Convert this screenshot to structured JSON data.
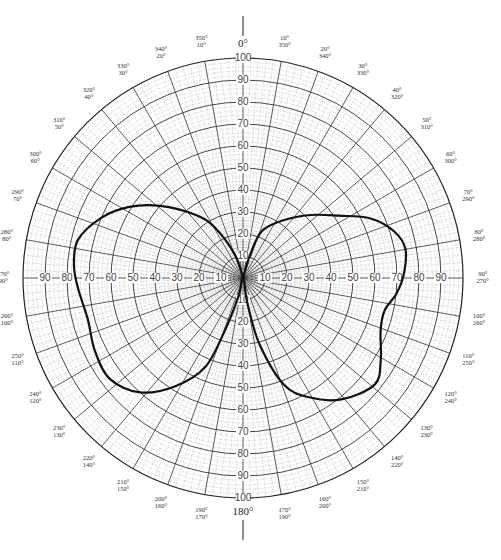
{
  "chart_data": {
    "type": "polar",
    "title": "",
    "radial_axis": {
      "min": 0,
      "max": 100,
      "major_step": 10,
      "minor_step": 2,
      "tick_labels": [
        "10",
        "20",
        "30",
        "40",
        "50",
        "60",
        "70",
        "80",
        "90",
        "100"
      ]
    },
    "angular_axis": {
      "major_step_deg": 10,
      "minor_step_deg": 2,
      "direction": "clockwise",
      "zero": "top"
    },
    "cardinal_labels": {
      "top": "0°",
      "bottom": "180°"
    },
    "angle_labels": [
      {
        "deg": 10,
        "outer": "10°",
        "inner": "350°"
      },
      {
        "deg": 20,
        "outer": "20°",
        "inner": "340°"
      },
      {
        "deg": 30,
        "outer": "30°",
        "inner": "330°"
      },
      {
        "deg": 40,
        "outer": "40°",
        "inner": "320°"
      },
      {
        "deg": 50,
        "outer": "50°",
        "inner": "310°"
      },
      {
        "deg": 60,
        "outer": "60°",
        "inner": "300°"
      },
      {
        "deg": 70,
        "outer": "70°",
        "inner": "290°"
      },
      {
        "deg": 80,
        "outer": "80°",
        "inner": "280°"
      },
      {
        "deg": 90,
        "outer": "90°",
        "inner": "270°"
      },
      {
        "deg": 100,
        "outer": "100°",
        "inner": "260°"
      },
      {
        "deg": 110,
        "outer": "110°",
        "inner": "250°"
      },
      {
        "deg": 120,
        "outer": "120°",
        "inner": "240°"
      },
      {
        "deg": 130,
        "outer": "130°",
        "inner": "230°"
      },
      {
        "deg": 140,
        "outer": "140°",
        "inner": "220°"
      },
      {
        "deg": 150,
        "outer": "150°",
        "inner": "210°"
      },
      {
        "deg": 160,
        "outer": "160°",
        "inner": "200°"
      },
      {
        "deg": 170,
        "outer": "170°",
        "inner": "190°"
      },
      {
        "deg": 190,
        "outer": "190°",
        "inner": "170°"
      },
      {
        "deg": 200,
        "outer": "200°",
        "inner": "160°"
      },
      {
        "deg": 210,
        "outer": "210°",
        "inner": "150°"
      },
      {
        "deg": 220,
        "outer": "220°",
        "inner": "140°"
      },
      {
        "deg": 230,
        "outer": "230°",
        "inner": "130°"
      },
      {
        "deg": 240,
        "outer": "240°",
        "inner": "120°"
      },
      {
        "deg": 250,
        "outer": "250°",
        "inner": "110°"
      },
      {
        "deg": 260,
        "outer": "260°",
        "inner": "100°"
      },
      {
        "deg": 270,
        "outer": "270°",
        "inner": "90°"
      },
      {
        "deg": 280,
        "outer": "280°",
        "inner": "80°"
      },
      {
        "deg": 290,
        "outer": "290°",
        "inner": "70°"
      },
      {
        "deg": 300,
        "outer": "300°",
        "inner": "60°"
      },
      {
        "deg": 310,
        "outer": "310°",
        "inner": "50°"
      },
      {
        "deg": 320,
        "outer": "320°",
        "inner": "40°"
      },
      {
        "deg": 330,
        "outer": "330°",
        "inner": "30°"
      },
      {
        "deg": 340,
        "outer": "340°",
        "inner": "20°"
      },
      {
        "deg": 350,
        "outer": "350°",
        "inner": "10°"
      }
    ],
    "series": [
      {
        "name": "radiation pattern",
        "color": "#111111",
        "points": [
          {
            "angle": 0,
            "r": 0
          },
          {
            "angle": 17,
            "r": 11
          },
          {
            "angle": 22,
            "r": 23
          },
          {
            "angle": 35,
            "r": 32
          },
          {
            "angle": 47,
            "r": 42
          },
          {
            "angle": 57,
            "r": 52
          },
          {
            "angle": 65,
            "r": 64
          },
          {
            "angle": 73,
            "r": 72
          },
          {
            "angle": 80,
            "r": 75
          },
          {
            "angle": 89,
            "r": 73
          },
          {
            "angle": 96,
            "r": 70
          },
          {
            "angle": 103,
            "r": 66
          },
          {
            "angle": 111,
            "r": 67
          },
          {
            "angle": 121,
            "r": 73
          },
          {
            "angle": 129,
            "r": 77
          },
          {
            "angle": 141,
            "r": 71
          },
          {
            "angle": 151,
            "r": 62
          },
          {
            "angle": 159,
            "r": 52
          },
          {
            "angle": 166,
            "r": 31
          },
          {
            "angle": 170,
            "r": 12
          },
          {
            "angle": 180,
            "r": 0
          },
          {
            "angle": 194,
            "r": 9
          },
          {
            "angle": 199,
            "r": 25
          },
          {
            "angle": 203,
            "r": 44
          },
          {
            "angle": 212,
            "r": 58
          },
          {
            "angle": 222,
            "r": 70
          },
          {
            "angle": 233,
            "r": 76
          },
          {
            "angle": 244,
            "r": 75
          },
          {
            "angle": 255,
            "r": 73
          },
          {
            "angle": 266,
            "r": 75
          },
          {
            "angle": 274,
            "r": 77
          },
          {
            "angle": 283,
            "r": 77
          },
          {
            "angle": 293,
            "r": 70
          },
          {
            "angle": 302,
            "r": 61
          },
          {
            "angle": 311,
            "r": 50
          },
          {
            "angle": 323,
            "r": 36
          },
          {
            "angle": 331,
            "r": 26
          },
          {
            "angle": 341,
            "r": 11
          },
          {
            "angle": 360,
            "r": 0
          }
        ]
      }
    ]
  }
}
